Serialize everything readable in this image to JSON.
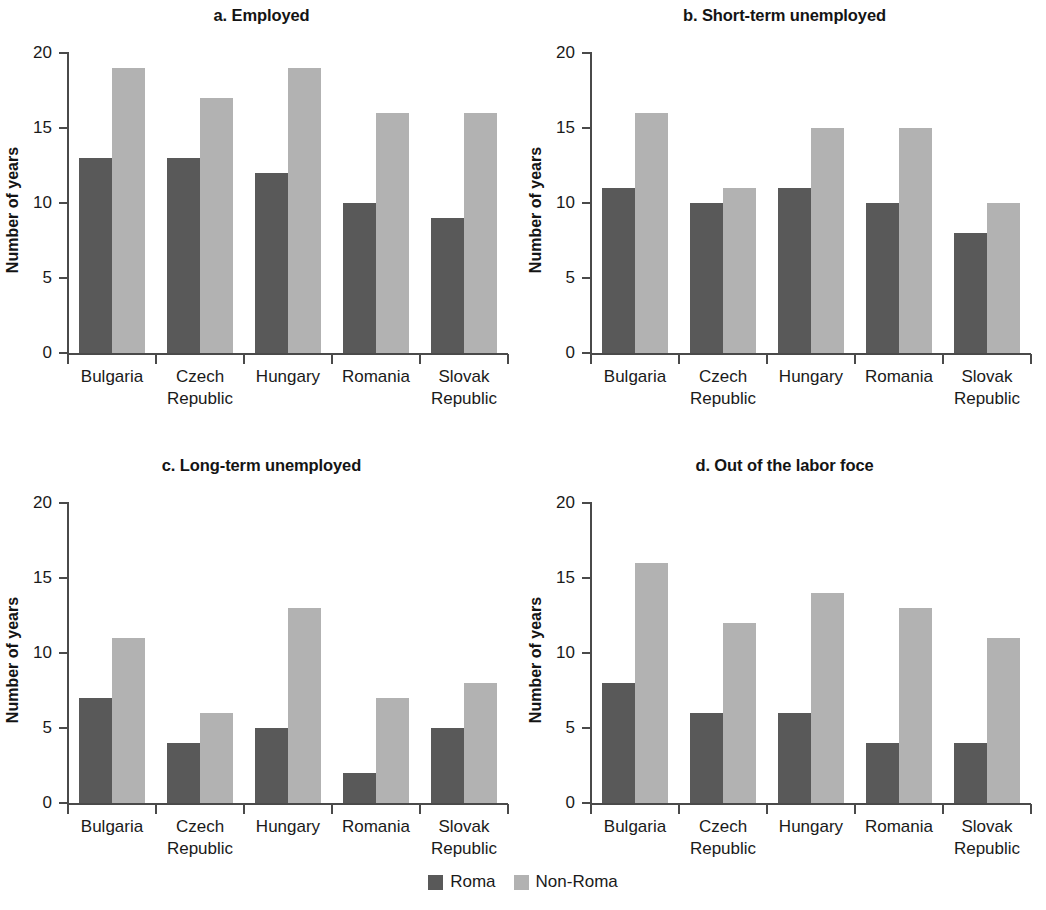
{
  "figure": {
    "ylabel": "Number of years",
    "categories": [
      "Bulgaria",
      "Czech Republic",
      "Hungary",
      "Romania",
      "Slovak Republic"
    ],
    "category_lines": [
      [
        "Bulgaria",
        ""
      ],
      [
        "Czech",
        "Republic"
      ],
      [
        "Hungary",
        ""
      ],
      [
        "Romania",
        ""
      ],
      [
        "Slovak",
        "Republic"
      ]
    ],
    "yticks": [
      "0",
      "5",
      "10",
      "15",
      "20"
    ],
    "ylim": [
      0,
      20
    ],
    "colors": {
      "roma": "#595959",
      "nonroma": "#b2b2b2",
      "axis": "#4a4a4a",
      "text": "#1a1a1a"
    },
    "legend": [
      {
        "label": "Roma",
        "color": "#595959"
      },
      {
        "label": "Non-Roma",
        "color": "#b2b2b2"
      }
    ],
    "panels": [
      {
        "key": "a",
        "title": "a. Employed"
      },
      {
        "key": "b",
        "title": "b. Short-term unemployed"
      },
      {
        "key": "c",
        "title": "c. Long-term unemployed"
      },
      {
        "key": "d",
        "title": "d. Out of the labor foce"
      }
    ]
  },
  "chart_data": [
    {
      "type": "bar",
      "title": "a. Employed",
      "xlabel": "",
      "ylabel": "Number of years",
      "ylim": [
        0,
        20
      ],
      "yticks": [
        0,
        5,
        10,
        15,
        20
      ],
      "grid": false,
      "legend_position": "bottom-center",
      "categories": [
        "Bulgaria",
        "Czech Republic",
        "Hungary",
        "Romania",
        "Slovak Republic"
      ],
      "series": [
        {
          "name": "Roma",
          "values": [
            13,
            13,
            12,
            10,
            9
          ]
        },
        {
          "name": "Non-Roma",
          "values": [
            19,
            17,
            19,
            16,
            16
          ]
        }
      ]
    },
    {
      "type": "bar",
      "title": "b. Short-term unemployed",
      "xlabel": "",
      "ylabel": "Number of years",
      "ylim": [
        0,
        20
      ],
      "yticks": [
        0,
        5,
        10,
        15,
        20
      ],
      "grid": false,
      "legend_position": "bottom-center",
      "categories": [
        "Bulgaria",
        "Czech Republic",
        "Hungary",
        "Romania",
        "Slovak Republic"
      ],
      "series": [
        {
          "name": "Roma",
          "values": [
            11,
            10,
            11,
            10,
            8
          ]
        },
        {
          "name": "Non-Roma",
          "values": [
            16,
            11,
            15,
            15,
            10
          ]
        }
      ]
    },
    {
      "type": "bar",
      "title": "c. Long-term unemployed",
      "xlabel": "",
      "ylabel": "Number of years",
      "ylim": [
        0,
        20
      ],
      "yticks": [
        0,
        5,
        10,
        15,
        20
      ],
      "grid": false,
      "legend_position": "bottom-center",
      "categories": [
        "Bulgaria",
        "Czech Republic",
        "Hungary",
        "Romania",
        "Slovak Republic"
      ],
      "series": [
        {
          "name": "Roma",
          "values": [
            7,
            4,
            5,
            2,
            5
          ]
        },
        {
          "name": "Non-Roma",
          "values": [
            11,
            6,
            13,
            7,
            8
          ]
        }
      ]
    },
    {
      "type": "bar",
      "title": "d. Out of the labor foce",
      "xlabel": "",
      "ylabel": "Number of years",
      "ylim": [
        0,
        20
      ],
      "yticks": [
        0,
        5,
        10,
        15,
        20
      ],
      "grid": false,
      "legend_position": "bottom-center",
      "categories": [
        "Bulgaria",
        "Czech Republic",
        "Hungary",
        "Romania",
        "Slovak Republic"
      ],
      "series": [
        {
          "name": "Roma",
          "values": [
            8,
            6,
            6,
            4,
            4
          ]
        },
        {
          "name": "Non-Roma",
          "values": [
            16,
            12,
            14,
            13,
            11
          ]
        }
      ]
    }
  ]
}
